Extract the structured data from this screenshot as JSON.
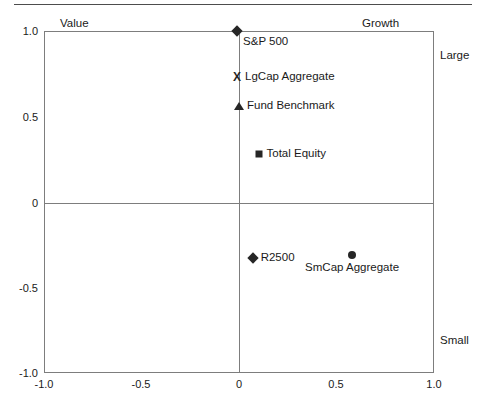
{
  "chart_data": {
    "type": "scatter",
    "title": "",
    "xlabel": "",
    "ylabel": "",
    "xlim": [
      -1.0,
      1.0
    ],
    "ylim": [
      -1.0,
      1.0
    ],
    "grid": false,
    "legend": "none",
    "quadrant_lines": {
      "x": 0,
      "y": 0
    },
    "axis_annotations": {
      "left_top": "Value",
      "right_top": "Growth",
      "right_upper": "Large",
      "right_lower": "Small"
    },
    "xticks": [
      "-1.0",
      "-0.5",
      "0",
      "0.5",
      "1.0"
    ],
    "xtick_values": [
      -1.0,
      -0.5,
      0,
      0.5,
      1.0
    ],
    "yticks": [
      "1.0",
      "0.5",
      "0",
      "-0.5",
      "-1.0"
    ],
    "ytick_values": [
      1.0,
      0.5,
      0,
      -0.5,
      -1.0
    ],
    "points": [
      {
        "name": "S&P 500",
        "x": -0.01,
        "y": 1.0,
        "marker": "diamond",
        "label_pos": "right-below"
      },
      {
        "name": "LgCap Aggregate",
        "x": -0.01,
        "y": 0.73,
        "marker": "cross",
        "label_pos": "right"
      },
      {
        "name": "Fund Benchmark",
        "x": 0.0,
        "y": 0.56,
        "marker": "triangle",
        "label_pos": "right"
      },
      {
        "name": "Total Equity",
        "x": 0.1,
        "y": 0.28,
        "marker": "square",
        "label_pos": "right"
      },
      {
        "name": "R2500",
        "x": 0.07,
        "y": -0.33,
        "marker": "diamond",
        "label_pos": "right"
      },
      {
        "name": "SmCap Aggregate",
        "x": 0.58,
        "y": -0.31,
        "marker": "circle",
        "label_pos": "below"
      }
    ]
  },
  "markers": {
    "cross_glyph": "X"
  },
  "colors": {
    "marker": "#262626",
    "frame": "#7d7d7d",
    "text": "#1a1a1a",
    "rule": "#4d4d4d"
  }
}
